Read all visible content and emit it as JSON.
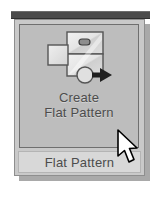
{
  "panel": {
    "title": "Flat Pattern",
    "command": {
      "label_line1": "Create",
      "label_line2": "Flat Pattern",
      "icon": "create-flat-pattern-icon"
    }
  },
  "cursor": {
    "icon": "mouse-arrow-pointer"
  },
  "colors": {
    "panel_background": "#c9c9c9",
    "button_background": "#bdbdbd",
    "button_border": "#6f6f6f",
    "panel_border": "#8e8e8e",
    "title_background": "#d8d8d8",
    "text": "#4c4c4c",
    "top_rule": "#4b4b4b",
    "shadow": "#a9a9a9",
    "icon_line": "#555555",
    "icon_fill_light": "#ededed",
    "icon_fill_mid": "#d2d2d2",
    "arrow_fill": "#1f1f1f",
    "cursor_fill": "#ffffff",
    "cursor_outline": "#000000"
  }
}
